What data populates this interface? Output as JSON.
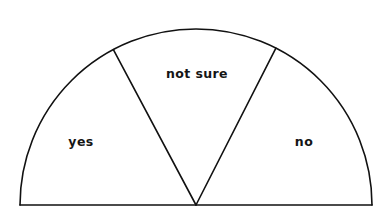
{
  "figure": {
    "type": "half-pie-sector-diagram",
    "title": "",
    "background_color": "#ffffff",
    "stroke_color": "#111111",
    "label_color": "#151515"
  },
  "geometry": {
    "center_x": 196,
    "center_y": 205,
    "radius": 176,
    "baseline_left_x": 20,
    "baseline_right_x": 372,
    "baseline_y": 205,
    "arc_top_y": 21
  },
  "chart_data": {
    "type": "pie",
    "title": "",
    "xlabel": "",
    "ylabel": "",
    "variant": "half-pie",
    "total_degrees": 180,
    "legend_position": "inside-slices",
    "grid": false,
    "categories": [
      "yes",
      "not sure",
      "no"
    ],
    "values": [
      62,
      55,
      63
    ],
    "units": "degrees",
    "slices": [
      {
        "label": "yes",
        "start_angle_deg": 118,
        "end_angle_deg": 180,
        "sweep_deg": 62,
        "fill": "#ffffff",
        "label_x": 81,
        "label_y": 141
      },
      {
        "label": "not sure",
        "start_angle_deg": 63,
        "end_angle_deg": 118,
        "sweep_deg": 55,
        "fill": "#ffffff",
        "label_x": 197,
        "label_y": 73
      },
      {
        "label": "no",
        "start_angle_deg": 0,
        "end_angle_deg": 63,
        "sweep_deg": 63,
        "fill": "#ffffff",
        "label_x": 304,
        "label_y": 141
      }
    ]
  },
  "labels": {
    "yes": "yes",
    "not_sure": "not sure",
    "no": "no"
  }
}
